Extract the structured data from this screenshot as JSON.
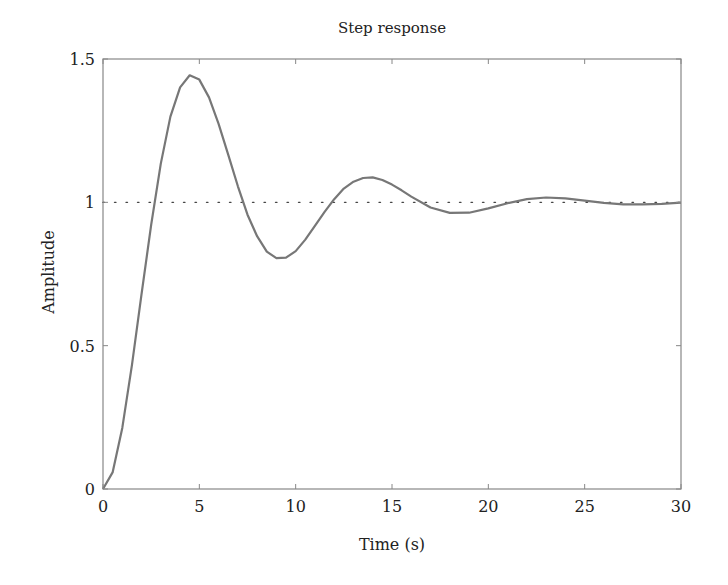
{
  "chart_data": {
    "type": "line",
    "title": "Step response",
    "xlabel": "Time (s)",
    "ylabel": "Amplitude",
    "xlim": [
      0,
      30
    ],
    "ylim": [
      0,
      1.5
    ],
    "xticks": [
      0,
      5,
      10,
      15,
      20,
      25,
      30
    ],
    "xtick_labels": [
      "0",
      "5",
      "10",
      "15",
      "20",
      "25",
      "30"
    ],
    "yticks": [
      0,
      0.5,
      1,
      1.5
    ],
    "ytick_labels": [
      "0",
      "0.5",
      "1",
      "1.5"
    ],
    "grid": false,
    "legend": null,
    "reference_line": {
      "y": 1,
      "style": "dotted",
      "color": "#444444"
    },
    "series": [
      {
        "name": "Step response",
        "color": "#777777",
        "x": [
          0,
          0.5,
          1,
          1.5,
          2,
          2.5,
          3,
          3.5,
          4,
          4.5,
          5,
          5.5,
          6,
          6.5,
          7,
          7.5,
          8,
          8.5,
          9,
          9.5,
          10,
          10.5,
          11,
          11.5,
          12,
          12.5,
          13,
          13.5,
          14,
          14.5,
          15,
          15.5,
          16,
          17,
          18,
          19,
          20,
          21,
          22,
          23,
          24,
          25,
          26,
          27,
          28,
          29,
          30
        ],
        "values": [
          0,
          0.058,
          0.213,
          0.431,
          0.679,
          0.922,
          1.135,
          1.299,
          1.401,
          1.443,
          1.428,
          1.366,
          1.274,
          1.166,
          1.056,
          0.957,
          0.882,
          0.828,
          0.805,
          0.807,
          0.83,
          0.87,
          0.918,
          0.967,
          1.011,
          1.048,
          1.072,
          1.085,
          1.087,
          1.078,
          1.062,
          1.042,
          1.02,
          0.982,
          0.963,
          0.964,
          0.979,
          0.997,
          1.011,
          1.017,
          1.014,
          1.006,
          0.998,
          0.993,
          0.993,
          0.995,
          0.999
        ]
      }
    ]
  },
  "colors": {
    "axis": "#888888",
    "text": "#222222",
    "curve": "#777777",
    "reference": "#444444"
  }
}
